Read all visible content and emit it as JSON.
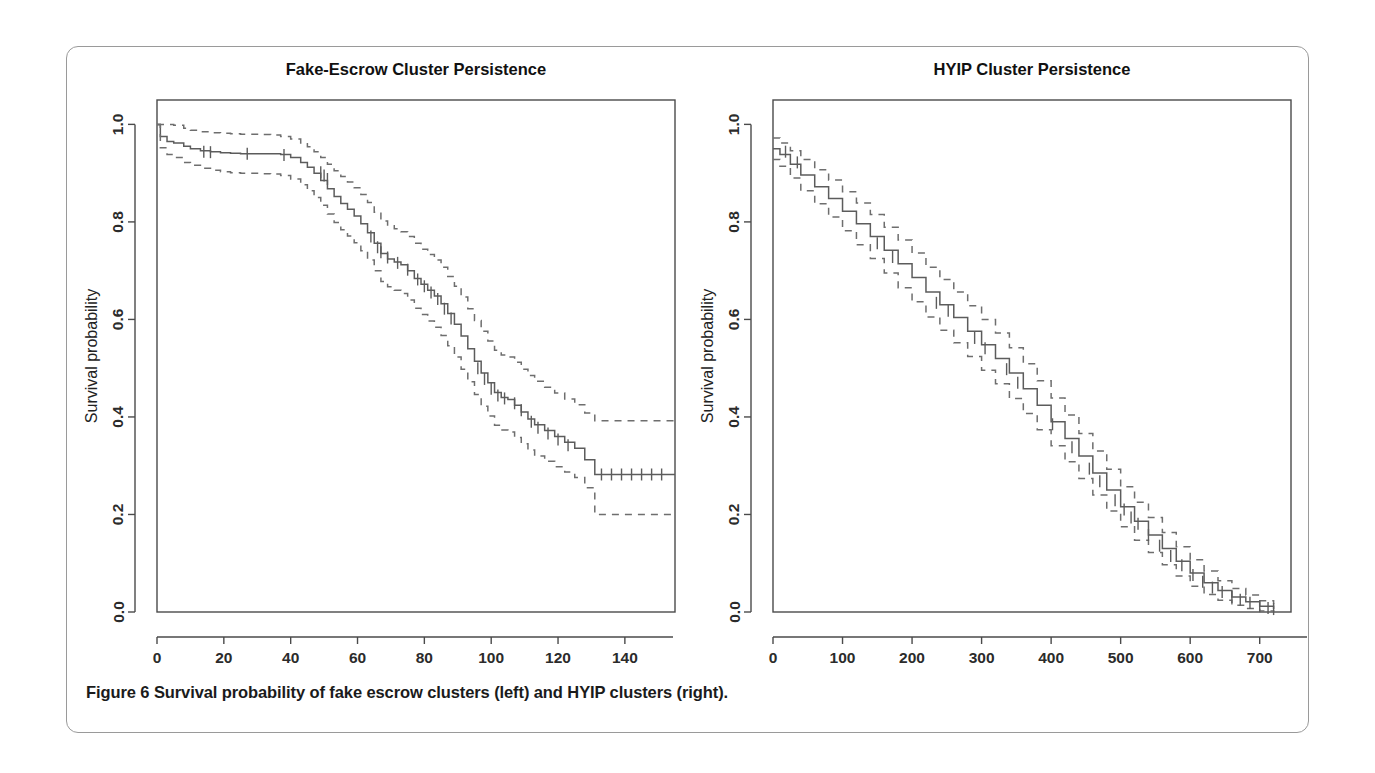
{
  "figure": {
    "caption_label": "Figure 6",
    "caption_text": "Survival probability of fake escrow clusters (left) and HYIP clusters (right)."
  },
  "chart_data": [
    {
      "id": "fake-escrow",
      "type": "line",
      "title": "Fake-Escrow Cluster Persistence",
      "xlabel": "Days between first and last appearance in cluster",
      "ylabel": "Survival probability",
      "xlim": [
        0,
        155
      ],
      "ylim": [
        0.0,
        1.05
      ],
      "xticks": [
        0,
        20,
        40,
        60,
        80,
        100,
        120,
        140
      ],
      "xticklabels": [
        "0",
        "20",
        "40",
        "60",
        "80",
        "100",
        "120",
        "140"
      ],
      "yticks": [
        0.0,
        0.2,
        0.4,
        0.6,
        0.8,
        1.0
      ],
      "yticklabels": [
        "0.0",
        "0.2",
        "0.4",
        "0.6",
        "0.8",
        "1.0"
      ],
      "grid": false,
      "legend": "none",
      "series": [
        {
          "name": "Survival estimate",
          "style": "step-solid",
          "x": [
            0,
            1,
            3,
            5,
            8,
            10,
            13,
            16,
            19,
            22,
            25,
            28,
            31,
            34,
            37,
            40,
            43,
            45,
            47,
            49,
            51,
            53,
            55,
            57,
            59,
            61,
            63,
            65,
            67,
            69,
            71,
            73,
            75,
            77,
            79,
            81,
            83,
            85,
            87,
            89,
            91,
            93,
            95,
            97,
            99,
            101,
            103,
            105,
            107,
            109,
            111,
            113,
            116,
            119,
            122,
            125,
            128,
            131,
            155
          ],
          "y": [
            1.0,
            0.975,
            0.965,
            0.962,
            0.955,
            0.95,
            0.946,
            0.944,
            0.942,
            0.941,
            0.94,
            0.94,
            0.94,
            0.94,
            0.938,
            0.932,
            0.922,
            0.912,
            0.9,
            0.885,
            0.868,
            0.852,
            0.838,
            0.826,
            0.812,
            0.796,
            0.778,
            0.756,
            0.735,
            0.724,
            0.718,
            0.712,
            0.7,
            0.684,
            0.672,
            0.66,
            0.648,
            0.632,
            0.612,
            0.59,
            0.566,
            0.54,
            0.514,
            0.49,
            0.47,
            0.45,
            0.44,
            0.436,
            0.424,
            0.41,
            0.396,
            0.384,
            0.372,
            0.36,
            0.348,
            0.336,
            0.312,
            0.282,
            0.282
          ]
        },
        {
          "name": "Upper 95% CI",
          "style": "step-dashed",
          "x": [
            0,
            1,
            3,
            5,
            8,
            10,
            13,
            16,
            19,
            22,
            25,
            28,
            31,
            34,
            37,
            40,
            43,
            45,
            47,
            49,
            51,
            53,
            55,
            57,
            59,
            61,
            63,
            65,
            67,
            69,
            71,
            73,
            75,
            77,
            79,
            81,
            83,
            85,
            87,
            89,
            91,
            93,
            95,
            97,
            99,
            101,
            103,
            105,
            107,
            109,
            111,
            113,
            116,
            119,
            122,
            125,
            128,
            131,
            155
          ],
          "y": [
            1.0,
            1.0,
            1.0,
            0.998,
            0.992,
            0.988,
            0.985,
            0.983,
            0.982,
            0.981,
            0.98,
            0.98,
            0.979,
            0.978,
            0.975,
            0.97,
            0.962,
            0.954,
            0.944,
            0.932,
            0.918,
            0.905,
            0.893,
            0.882,
            0.87,
            0.856,
            0.84,
            0.82,
            0.802,
            0.792,
            0.786,
            0.78,
            0.77,
            0.756,
            0.744,
            0.733,
            0.722,
            0.707,
            0.688,
            0.668,
            0.646,
            0.622,
            0.598,
            0.576,
            0.556,
            0.537,
            0.527,
            0.523,
            0.512,
            0.498,
            0.485,
            0.473,
            0.461,
            0.449,
            0.437,
            0.425,
            0.408,
            0.392,
            0.392
          ]
        },
        {
          "name": "Lower 95% CI",
          "style": "step-dashed",
          "x": [
            0,
            1,
            3,
            5,
            8,
            10,
            13,
            16,
            19,
            22,
            25,
            28,
            31,
            34,
            37,
            40,
            43,
            45,
            47,
            49,
            51,
            53,
            55,
            57,
            59,
            61,
            63,
            65,
            67,
            69,
            71,
            73,
            75,
            77,
            79,
            81,
            83,
            85,
            87,
            89,
            91,
            93,
            95,
            97,
            99,
            101,
            103,
            105,
            107,
            109,
            111,
            113,
            116,
            119,
            122,
            125,
            128,
            131,
            155
          ],
          "y": [
            1.0,
            0.952,
            0.938,
            0.932,
            0.922,
            0.916,
            0.91,
            0.906,
            0.903,
            0.901,
            0.9,
            0.9,
            0.899,
            0.898,
            0.895,
            0.888,
            0.876,
            0.864,
            0.85,
            0.834,
            0.816,
            0.799,
            0.784,
            0.771,
            0.757,
            0.741,
            0.722,
            0.7,
            0.678,
            0.667,
            0.66,
            0.653,
            0.64,
            0.623,
            0.61,
            0.597,
            0.584,
            0.567,
            0.546,
            0.523,
            0.498,
            0.472,
            0.446,
            0.422,
            0.402,
            0.383,
            0.373,
            0.369,
            0.358,
            0.345,
            0.332,
            0.32,
            0.309,
            0.298,
            0.287,
            0.276,
            0.255,
            0.2,
            0.2
          ]
        }
      ],
      "censor_marks": [
        {
          "x": 14,
          "y": 0.944
        },
        {
          "x": 16,
          "y": 0.943
        },
        {
          "x": 27,
          "y": 0.94
        },
        {
          "x": 38,
          "y": 0.937
        },
        {
          "x": 49,
          "y": 0.902
        },
        {
          "x": 50,
          "y": 0.895
        },
        {
          "x": 51,
          "y": 0.888
        },
        {
          "x": 64,
          "y": 0.77
        },
        {
          "x": 66,
          "y": 0.748
        },
        {
          "x": 67,
          "y": 0.738
        },
        {
          "x": 69,
          "y": 0.727
        },
        {
          "x": 72,
          "y": 0.716
        },
        {
          "x": 75,
          "y": 0.702
        },
        {
          "x": 78,
          "y": 0.682
        },
        {
          "x": 80,
          "y": 0.668
        },
        {
          "x": 82,
          "y": 0.655
        },
        {
          "x": 84,
          "y": 0.642
        },
        {
          "x": 86,
          "y": 0.622
        },
        {
          "x": 88,
          "y": 0.602
        },
        {
          "x": 96,
          "y": 0.5
        },
        {
          "x": 98,
          "y": 0.478
        },
        {
          "x": 100,
          "y": 0.458
        },
        {
          "x": 102,
          "y": 0.444
        },
        {
          "x": 104,
          "y": 0.438
        },
        {
          "x": 107,
          "y": 0.428
        },
        {
          "x": 109,
          "y": 0.414
        },
        {
          "x": 112,
          "y": 0.39
        },
        {
          "x": 114,
          "y": 0.378
        },
        {
          "x": 117,
          "y": 0.366
        },
        {
          "x": 120,
          "y": 0.354
        },
        {
          "x": 123,
          "y": 0.342
        },
        {
          "x": 133,
          "y": 0.282
        },
        {
          "x": 136,
          "y": 0.282
        },
        {
          "x": 139,
          "y": 0.282
        },
        {
          "x": 142,
          "y": 0.282
        },
        {
          "x": 145,
          "y": 0.282
        },
        {
          "x": 148,
          "y": 0.282
        },
        {
          "x": 151,
          "y": 0.282
        }
      ]
    },
    {
      "id": "hyip",
      "type": "line",
      "title": "HYIP Cluster Persistence",
      "xlabel": "Days between first and last appearance in cluster",
      "ylabel": "Survival probability",
      "xlim": [
        0,
        745
      ],
      "ylim": [
        0.0,
        1.05
      ],
      "xticks": [
        0,
        100,
        200,
        300,
        400,
        500,
        600,
        700
      ],
      "xticklabels": [
        "0",
        "100",
        "200",
        "300",
        "400",
        "500",
        "600",
        "700"
      ],
      "yticks": [
        0.0,
        0.2,
        0.4,
        0.6,
        0.8,
        1.0
      ],
      "yticklabels": [
        "0.0",
        "0.2",
        "0.4",
        "0.6",
        "0.8",
        "1.0"
      ],
      "grid": false,
      "legend": "none",
      "series": [
        {
          "name": "Survival estimate",
          "style": "step-solid",
          "x": [
            0,
            10,
            25,
            40,
            60,
            80,
            100,
            120,
            140,
            160,
            180,
            200,
            220,
            240,
            260,
            280,
            300,
            320,
            340,
            360,
            380,
            400,
            420,
            440,
            460,
            480,
            500,
            520,
            540,
            560,
            580,
            600,
            620,
            640,
            660,
            680,
            700,
            720
          ],
          "y": [
            0.95,
            0.938,
            0.918,
            0.896,
            0.872,
            0.848,
            0.822,
            0.796,
            0.77,
            0.742,
            0.714,
            0.686,
            0.656,
            0.63,
            0.604,
            0.576,
            0.548,
            0.52,
            0.49,
            0.458,
            0.424,
            0.39,
            0.356,
            0.32,
            0.285,
            0.25,
            0.216,
            0.186,
            0.158,
            0.13,
            0.104,
            0.08,
            0.06,
            0.044,
            0.031,
            0.021,
            0.012,
            0.006
          ]
        },
        {
          "name": "Upper 95% CI",
          "style": "step-dashed",
          "x": [
            0,
            10,
            25,
            40,
            60,
            80,
            100,
            120,
            140,
            160,
            180,
            200,
            220,
            240,
            260,
            280,
            300,
            320,
            340,
            360,
            380,
            400,
            420,
            440,
            460,
            480,
            500,
            520,
            540,
            560,
            580,
            600,
            620,
            640,
            660,
            680,
            700,
            720
          ],
          "y": [
            0.972,
            0.962,
            0.946,
            0.928,
            0.907,
            0.886,
            0.862,
            0.839,
            0.815,
            0.789,
            0.763,
            0.736,
            0.707,
            0.682,
            0.656,
            0.628,
            0.6,
            0.572,
            0.542,
            0.509,
            0.474,
            0.439,
            0.404,
            0.366,
            0.33,
            0.293,
            0.257,
            0.225,
            0.194,
            0.163,
            0.134,
            0.107,
            0.084,
            0.064,
            0.048,
            0.035,
            0.023,
            0.016
          ]
        },
        {
          "name": "Lower 95% CI",
          "style": "step-dashed",
          "x": [
            0,
            10,
            25,
            40,
            60,
            80,
            100,
            120,
            140,
            160,
            180,
            200,
            220,
            240,
            260,
            280,
            300,
            320,
            340,
            360,
            380,
            400,
            420,
            440,
            460,
            480,
            500,
            520,
            540,
            560,
            580,
            600,
            620,
            640,
            660,
            680,
            700,
            720
          ],
          "y": [
            0.928,
            0.914,
            0.89,
            0.864,
            0.837,
            0.81,
            0.782,
            0.753,
            0.725,
            0.695,
            0.665,
            0.636,
            0.605,
            0.578,
            0.552,
            0.524,
            0.496,
            0.468,
            0.438,
            0.407,
            0.374,
            0.341,
            0.308,
            0.274,
            0.24,
            0.207,
            0.175,
            0.147,
            0.122,
            0.097,
            0.074,
            0.053,
            0.036,
            0.024,
            0.014,
            0.007,
            0.002,
            0.0
          ]
        }
      ],
      "censor_marks": [
        {
          "x": 18,
          "y": 0.944
        },
        {
          "x": 35,
          "y": 0.922
        },
        {
          "x": 150,
          "y": 0.756
        },
        {
          "x": 172,
          "y": 0.728
        },
        {
          "x": 235,
          "y": 0.634
        },
        {
          "x": 252,
          "y": 0.618
        },
        {
          "x": 290,
          "y": 0.562
        },
        {
          "x": 305,
          "y": 0.541
        },
        {
          "x": 336,
          "y": 0.498
        },
        {
          "x": 352,
          "y": 0.47
        },
        {
          "x": 402,
          "y": 0.385
        },
        {
          "x": 430,
          "y": 0.338
        },
        {
          "x": 455,
          "y": 0.294
        },
        {
          "x": 470,
          "y": 0.268
        },
        {
          "x": 492,
          "y": 0.229
        },
        {
          "x": 505,
          "y": 0.21
        },
        {
          "x": 515,
          "y": 0.194
        },
        {
          "x": 525,
          "y": 0.181
        },
        {
          "x": 540,
          "y": 0.158
        },
        {
          "x": 556,
          "y": 0.136
        },
        {
          "x": 572,
          "y": 0.115
        },
        {
          "x": 588,
          "y": 0.096
        },
        {
          "x": 604,
          "y": 0.076
        },
        {
          "x": 618,
          "y": 0.062
        },
        {
          "x": 632,
          "y": 0.05
        },
        {
          "x": 646,
          "y": 0.041
        },
        {
          "x": 660,
          "y": 0.031
        },
        {
          "x": 672,
          "y": 0.025
        },
        {
          "x": 686,
          "y": 0.019
        },
        {
          "x": 700,
          "y": 0.012
        },
        {
          "x": 712,
          "y": 0.008
        },
        {
          "x": 720,
          "y": 0.006
        }
      ]
    }
  ]
}
